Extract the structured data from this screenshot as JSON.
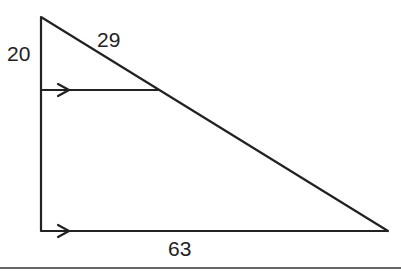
{
  "diagram": {
    "type": "triangle-with-parallel-segment",
    "labels": {
      "left_upper_side": "20",
      "hypotenuse_upper": "29",
      "base": "63"
    },
    "colors": {
      "stroke": "#222222",
      "background": "#ffffff"
    }
  }
}
